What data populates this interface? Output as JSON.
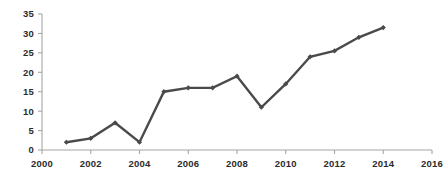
{
  "chart_data": {
    "type": "line",
    "title": "",
    "subtitle": "",
    "xlabel": "",
    "ylabel": "",
    "xlim": [
      2000,
      2016
    ],
    "ylim": [
      0,
      35
    ],
    "grid": false,
    "legend": false,
    "legend_position": "none",
    "x_tick_labels": [
      "2000",
      "2002",
      "2004",
      "2006",
      "2008",
      "2010",
      "2012",
      "2014",
      "2016"
    ],
    "x_ticks": [
      2000,
      2002,
      2004,
      2006,
      2008,
      2010,
      2012,
      2014,
      2016
    ],
    "y_tick_labels": [
      "0",
      "5",
      "10",
      "15",
      "20",
      "25",
      "30",
      "35"
    ],
    "y_ticks": [
      0,
      5,
      10,
      15,
      20,
      25,
      30,
      35
    ],
    "x": [
      2001,
      2002,
      2003,
      2004,
      2005,
      2006,
      2007,
      2008,
      2009,
      2010,
      2011,
      2012,
      2013,
      2014
    ],
    "series": [
      {
        "name": "series-1",
        "color": "#4a4a4a",
        "marker": "diamond",
        "values": [
          2,
          3,
          7,
          2,
          15,
          16,
          16,
          19,
          11,
          17,
          24,
          25.5,
          29,
          31.5
        ]
      }
    ],
    "annotations": []
  },
  "style": {
    "axis_color": "#a6a6a6",
    "tick_label_color": "#2b2b2b",
    "plot_background": "#ffffff",
    "series_color": "#4a4a4a"
  }
}
